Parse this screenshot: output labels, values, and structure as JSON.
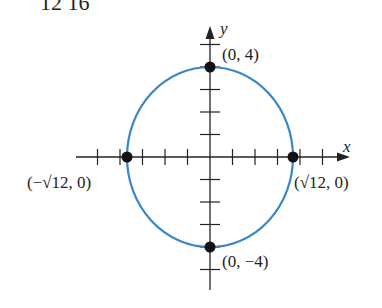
{
  "header": {
    "partial_text": "12      16"
  },
  "axes": {
    "x_label": "x",
    "y_label": "y"
  },
  "ellipse": {
    "equation": "x^2/12 + y^2/16 = 1",
    "stroke": "#3a86c8",
    "a": 3.4641,
    "b": 4
  },
  "points": [
    {
      "id": "top",
      "label": "(0, 4)",
      "x": 0,
      "y": 4
    },
    {
      "id": "bottom",
      "label": "(0, −4)",
      "x": 0,
      "y": -4
    },
    {
      "id": "left",
      "label": "(−√12, 0)",
      "x": -3.4641,
      "y": 0
    },
    {
      "id": "right",
      "label": "(√12, 0)",
      "x": 3.4641,
      "y": 0
    }
  ],
  "ticks": {
    "x": [
      -5,
      -4,
      -3,
      -2,
      -1,
      1,
      2,
      3,
      4,
      5
    ],
    "y": [
      -5,
      -4,
      -3,
      -2,
      -1,
      1,
      2,
      3,
      4,
      5
    ]
  }
}
